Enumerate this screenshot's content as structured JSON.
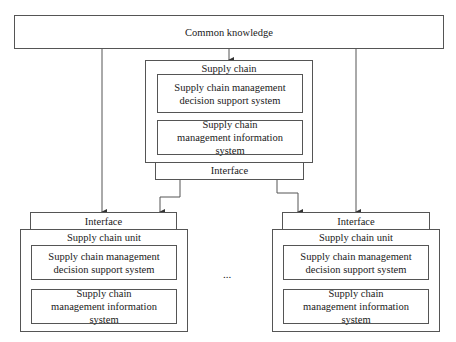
{
  "diagram": {
    "top": {
      "label": "Common knowledge"
    },
    "supply_chain": {
      "title": "Supply chain",
      "decision_system": "Supply chain management decision support system",
      "info_system": "Supply chain management information system",
      "interface": "Interface"
    },
    "units": [
      {
        "interface": "Interface",
        "title": "Supply chain unit",
        "decision_system": "Supply chain management decision support system",
        "info_system": "Supply chain management information system"
      },
      {
        "interface": "Interface",
        "title": "Supply chain unit",
        "decision_system": "Supply chain management decision support system",
        "info_system": "Supply chain management information system"
      }
    ],
    "ellipsis": "..."
  },
  "colors": {
    "line": "#555555",
    "background": "#ffffff",
    "text": "#1a1a1a"
  }
}
